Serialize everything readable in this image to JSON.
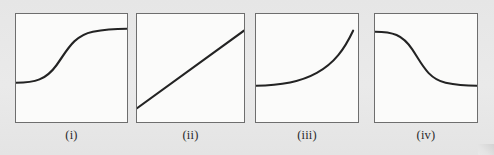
{
  "figure": {
    "kind": "multi-panel-curve-figure",
    "panel_count": 4,
    "background_color": "#e8e8e8",
    "panel_fill_color": "#fbfbfa",
    "panel_border_color": "#6e6e6e",
    "curve_color": "#232323"
  },
  "panels": [
    {
      "label": "(i)",
      "shape_name": "increasing-sigmoid",
      "description": "S-shaped curve increasing from low-left plateau to high-right plateau"
    },
    {
      "label": "(ii)",
      "shape_name": "straight-increasing-line",
      "description": "straight line increasing from lower-left to upper-right"
    },
    {
      "label": "(iii)",
      "shape_name": "convex-increasing-exponential",
      "description": "flat at left then sharply increasing convex curve to upper-right"
    },
    {
      "label": "(iv)",
      "shape_name": "decreasing-sigmoid",
      "description": "reverse S-shaped curve decreasing from high-left plateau to low-right plateau"
    }
  ],
  "chart_data": {
    "type": "line",
    "title": "",
    "xlabel": "",
    "ylabel": "",
    "grid": false,
    "legend_position": "none",
    "axis_ranges": {
      "x": [
        0,
        100
      ],
      "y": [
        0,
        100
      ]
    },
    "panels": [
      {
        "label": "(i)",
        "curve_type": "increasing sigmoid",
        "path_d": "M 0,70 C 18,70 28,67 38,52 C 48,37 54,22 72,18 C 86,15 96,15 104,15",
        "x": [
          0,
          10,
          20,
          30,
          40,
          50,
          60,
          70,
          80,
          90,
          100
        ],
        "y": [
          30,
          30.5,
          32,
          37,
          46,
          58,
          70,
          79,
          84,
          86,
          86
        ]
      },
      {
        "label": "(ii)",
        "curve_type": "straight line",
        "path_d": "M 0,96 L 104,17",
        "x": [
          0,
          25,
          50,
          75,
          100
        ],
        "y": [
          12,
          31,
          50,
          69,
          88
        ]
      },
      {
        "label": "(iii)",
        "curve_type": "convex increasing (exponential)",
        "path_d": "M 0,73 C 22,73 44,70 62,60 C 80,50 90,36 99,17",
        "x": [
          0,
          20,
          40,
          60,
          80,
          90,
          100
        ],
        "y": [
          33,
          34,
          38,
          45,
          60,
          72,
          86
        ]
      },
      {
        "label": "(iv)",
        "curve_type": "decreasing sigmoid",
        "path_d": "M 0,18 C 18,18 28,21 38,36 C 48,51 54,66 72,70 C 86,73 96,73 104,73",
        "x": [
          0,
          10,
          20,
          30,
          40,
          50,
          60,
          70,
          80,
          90,
          100
        ],
        "y": [
          86,
          85.5,
          84,
          79,
          70,
          58,
          46,
          37,
          32,
          30.5,
          30
        ]
      }
    ]
  }
}
